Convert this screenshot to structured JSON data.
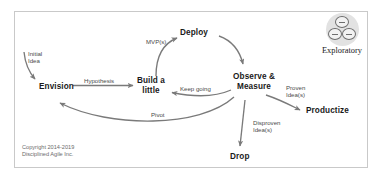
{
  "diagram": {
    "frame": {
      "border_color": "#c9c9c9",
      "background": "#ffffff"
    },
    "arrow_color": "#7a7a7a",
    "node_text_color": "#1a1a1a",
    "label_text_color": "#4a4a4a",
    "nodes": [
      {
        "id": "envision",
        "label": "Envision"
      },
      {
        "id": "build-a-little",
        "label": "Build a\nlittle",
        "line1": "Build a",
        "line2": "little"
      },
      {
        "id": "deploy",
        "label": "Deploy"
      },
      {
        "id": "observe-measure",
        "label": "Observe &\nMeasure",
        "line1": "Observe &",
        "line2": "Measure"
      },
      {
        "id": "productize",
        "label": "Productize"
      },
      {
        "id": "drop",
        "label": "Drop"
      }
    ],
    "edge_labels": [
      {
        "id": "initial-idea",
        "line1": "Initial",
        "line2": "Idea"
      },
      {
        "id": "hypothesis",
        "text": "Hypothesis"
      },
      {
        "id": "mvps",
        "text": "MVP(s)"
      },
      {
        "id": "keep-going",
        "text": "Keep going"
      },
      {
        "id": "pivot",
        "text": "Pivot"
      },
      {
        "id": "proven-ideas",
        "line1": "Proven",
        "line2": "Idea(s)"
      },
      {
        "id": "disproven-ideas",
        "line1": "Disproven",
        "line2": "Idea(s)"
      }
    ]
  },
  "logo": {
    "label": "Exploratory",
    "icon_name": "three-circles-icon",
    "disc_color": "#e2e2e2",
    "circle_stroke": "#6e6e6e"
  },
  "copyright": {
    "line1": "Copyright 2014-2019",
    "line2": "Disciplined Agile Inc."
  }
}
